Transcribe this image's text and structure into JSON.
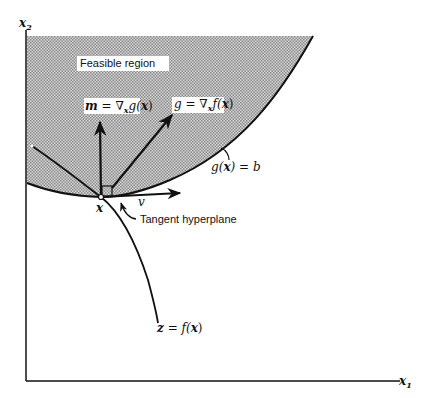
{
  "diagram": {
    "axes": {
      "x_label": "x",
      "x_sub": "1",
      "y_label": "x",
      "y_sub": "2"
    },
    "region_label": "Feasible region",
    "constraint_label": {
      "left": "g(",
      "var": "x",
      "right": ") = b"
    },
    "tangent_label": "Tangent hyperplane",
    "point_label": "x",
    "v_label": "v",
    "m_label": {
      "lhs": "m",
      "eq": " = ∇",
      "sub": "x",
      "fn": "g(",
      "var": "x",
      "close": ")"
    },
    "g_label": {
      "lhs": "g",
      "eq": " = ∇",
      "sub": "x",
      "fn": "f(",
      "var": "x",
      "close": ")"
    },
    "z_label": {
      "lhs": "z",
      "eq": " = f(",
      "var": "x",
      "close": ")"
    },
    "colors": {
      "region_fill": "#b8b8b8",
      "stroke": "#111111"
    }
  }
}
